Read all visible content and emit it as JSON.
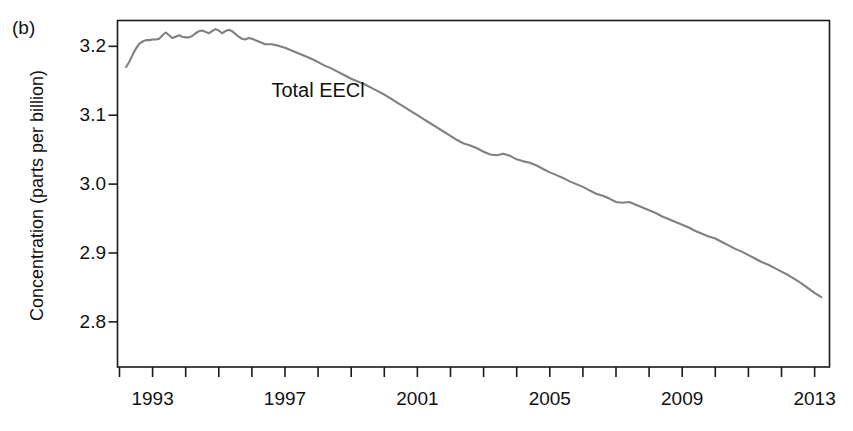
{
  "figure": {
    "panel_label": "(b)",
    "background_color": "#ffffff",
    "axis_color": "#1a1a1a",
    "text_color": "#111111"
  },
  "annotations": [
    {
      "text": "Total EECl",
      "x_year": 1998.0,
      "y_value": 3.137
    }
  ],
  "chart_data": {
    "type": "line",
    "title": "",
    "subtitle": "",
    "panel": "(b)",
    "xlabel": "",
    "ylabel": "Concentration (parts per billion)",
    "xlim": [
      1992.0,
      1993.4
    ],
    "ylim": [
      2.735,
      3.2375
    ],
    "x_axis_range": [
      1991.94,
      1993.4
    ],
    "grid": false,
    "legend": null,
    "legend_position": "none",
    "series_color": "#808080",
    "series_line_width": 2.1,
    "x_ticks_major": [
      1993,
      1997,
      2001,
      2005,
      2009,
      2013
    ],
    "x_tick_labels": [
      "1993",
      "1997",
      "2001",
      "2005",
      "2009",
      "2013"
    ],
    "x_ticks_minor": [
      1992,
      1994,
      1995,
      1996,
      1998,
      1999,
      2000,
      2002,
      2003,
      2004,
      2006,
      2007,
      2008,
      2010,
      2011,
      2012
    ],
    "y_ticks": [
      3.2,
      3.1,
      3.0,
      2.9,
      2.8
    ],
    "y_tick_labels": [
      "3.2",
      "3.1",
      "3.0",
      "2.9",
      "2.8"
    ],
    "axis_limits": {
      "x_min": 1991.94,
      "x_max": 2013.45,
      "y_min": 2.7345,
      "y_max": 3.2375
    },
    "series": [
      {
        "name": "Total EECl",
        "units": "parts per billion",
        "x": [
          1992.2,
          1992.3,
          1992.4,
          1992.5,
          1992.6,
          1992.7,
          1992.8,
          1992.9,
          1993.0,
          1993.1,
          1993.2,
          1993.3,
          1993.4,
          1993.5,
          1993.6,
          1993.7,
          1993.8,
          1993.9,
          1994.0,
          1994.1,
          1994.2,
          1994.3,
          1994.4,
          1994.5,
          1994.6,
          1994.7,
          1994.8,
          1994.9,
          1995.0,
          1995.1,
          1995.2,
          1995.3,
          1995.4,
          1995.5,
          1995.6,
          1995.7,
          1995.8,
          1995.9,
          1996.0,
          1996.2,
          1996.4,
          1996.6,
          1996.8,
          1997.0,
          1997.2,
          1997.4,
          1997.6,
          1997.8,
          1998.0,
          1998.2,
          1998.4,
          1998.6,
          1998.8,
          1999.0,
          1999.2,
          1999.4,
          1999.6,
          1999.8,
          2000.0,
          2000.2,
          2000.4,
          2000.6,
          2000.8,
          2001.0,
          2001.2,
          2001.4,
          2001.6,
          2001.8,
          2002.0,
          2002.2,
          2002.4,
          2002.6,
          2002.8,
          2003.0,
          2003.2,
          2003.4,
          2003.6,
          2003.8,
          2004.0,
          2004.2,
          2004.4,
          2004.6,
          2004.8,
          2005.0,
          2005.2,
          2005.4,
          2005.6,
          2005.8,
          2006.0,
          2006.2,
          2006.4,
          2006.6,
          2006.8,
          2007.0,
          2007.2,
          2007.4,
          2007.6,
          2007.8,
          2008.0,
          2008.2,
          2008.4,
          2008.6,
          2008.8,
          2009.0,
          2009.2,
          2009.4,
          2009.6,
          2009.8,
          2010.0,
          2010.2,
          2010.4,
          2010.6,
          2010.8,
          2011.0,
          2011.2,
          2011.4,
          2011.6,
          2011.8,
          2012.0,
          2012.2,
          2012.4,
          2012.6,
          2012.8,
          2013.0,
          2013.2
        ],
        "y": [
          3.17,
          3.178,
          3.188,
          3.197,
          3.204,
          3.207,
          3.209,
          3.209,
          3.21,
          3.21,
          3.211,
          3.216,
          3.22,
          3.216,
          3.212,
          3.214,
          3.216,
          3.214,
          3.213,
          3.213,
          3.215,
          3.219,
          3.222,
          3.223,
          3.221,
          3.219,
          3.222,
          3.225,
          3.223,
          3.219,
          3.222,
          3.224,
          3.222,
          3.218,
          3.214,
          3.211,
          3.21,
          3.212,
          3.211,
          3.207,
          3.203,
          3.203,
          3.201,
          3.198,
          3.194,
          3.19,
          3.186,
          3.182,
          3.177,
          3.172,
          3.168,
          3.163,
          3.158,
          3.153,
          3.149,
          3.145,
          3.14,
          3.135,
          3.13,
          3.124,
          3.118,
          3.112,
          3.106,
          3.1,
          3.094,
          3.088,
          3.082,
          3.076,
          3.07,
          3.064,
          3.059,
          3.056,
          3.052,
          3.047,
          3.043,
          3.042,
          3.044,
          3.041,
          3.036,
          3.033,
          3.031,
          3.027,
          3.022,
          3.017,
          3.013,
          3.009,
          3.004,
          3.0,
          2.996,
          2.991,
          2.986,
          2.983,
          2.979,
          2.974,
          2.973,
          2.974,
          2.97,
          2.966,
          2.962,
          2.958,
          2.953,
          2.949,
          2.945,
          2.941,
          2.937,
          2.932,
          2.928,
          2.924,
          2.921,
          2.916,
          2.911,
          2.906,
          2.902,
          2.897,
          2.892,
          2.887,
          2.883,
          2.878,
          2.873,
          2.868,
          2.862,
          2.856,
          2.849,
          2.842,
          2.836
        ]
      }
    ]
  }
}
